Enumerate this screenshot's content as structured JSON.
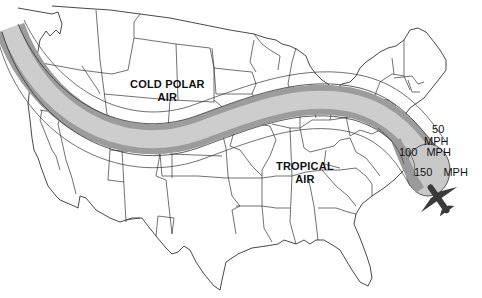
{
  "map": {
    "title": "",
    "region": "Continental United States",
    "colors": {
      "background": "#ffffff",
      "border_lines": "#333333",
      "jet_core_fill": "#c8c8c8",
      "jet_mid_fill": "#9a9a9a",
      "aircraft": "#3a3a3a"
    },
    "air_masses": [
      {
        "id": "cold",
        "line1": "COLD POLAR",
        "line2": "AIR"
      },
      {
        "id": "tropical",
        "line1": "TROPICAL",
        "line2": "AIR"
      }
    ],
    "speed_labels": [
      {
        "value": "50",
        "unit": "MPH"
      },
      {
        "value": "100",
        "unit": "MPH"
      },
      {
        "value": "150",
        "unit": "MPH"
      }
    ],
    "features": {
      "jet_stream": "jet-stream-band",
      "aircraft": "airplane-icon"
    }
  }
}
